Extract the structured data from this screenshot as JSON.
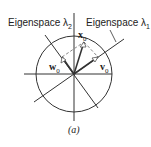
{
  "figure": {
    "caption": "(a)",
    "labels": {
      "eigenspace2": "Eigenspace λ",
      "eigenspace2_sub": "2",
      "eigenspace1": "Eigenspace λ",
      "eigenspace1_sub": "1"
    },
    "vectors": {
      "x": {
        "name": "x",
        "sub": "0"
      },
      "w": {
        "name": "w",
        "sub": "0"
      },
      "v": {
        "name": "v",
        "sub": "0"
      }
    },
    "colors": {
      "line": "#222222",
      "dashed": "#888888",
      "background": "#ffffff"
    }
  }
}
